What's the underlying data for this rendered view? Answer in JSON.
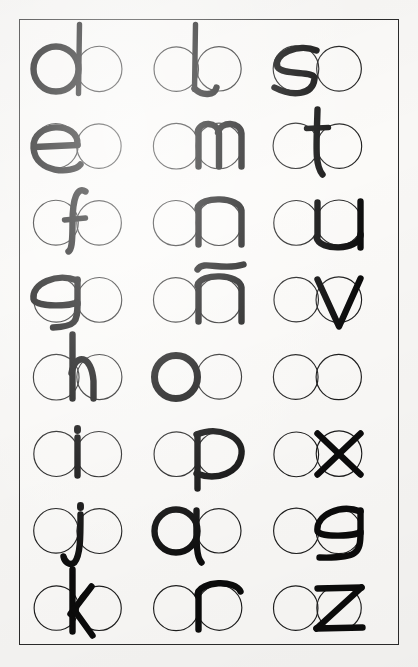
{
  "document": {
    "kind": "calligraphy-letterform-guide",
    "title": "Lowercase letterform construction chart",
    "description": "Lowercase letters drawn over paired guide circles",
    "background_color": "#f8f7f5",
    "paper_color": "#fbfaf8",
    "frame_color": "#2b2b2b",
    "ink_color": "#0b0b0b",
    "guide_color": "#1d1d1d"
  },
  "layout": {
    "rows": 8,
    "columns": 3,
    "cell_width": 118,
    "cell_height": 62,
    "circle_diameter": 45,
    "circles_per_cell": 2
  },
  "grid": {
    "rows": [
      {
        "cells": [
          {
            "letter": "d",
            "position": "left-circle",
            "stroke_weight": "heavy"
          },
          {
            "letter": "b",
            "position": "center",
            "stroke_weight": "heavy"
          },
          {
            "letter": "s",
            "position": "left-circle",
            "stroke_weight": "heavy"
          }
        ]
      },
      {
        "cells": [
          {
            "letter": "e",
            "position": "left-circle",
            "stroke_weight": "heavy"
          },
          {
            "letter": "m",
            "position": "right-circle",
            "stroke_weight": "heavy"
          },
          {
            "letter": "t",
            "position": "center",
            "stroke_weight": "heavy"
          }
        ]
      },
      {
        "cells": [
          {
            "letter": "f",
            "position": "center",
            "stroke_weight": "heavy"
          },
          {
            "letter": "n",
            "position": "right-circle",
            "stroke_weight": "heavy"
          },
          {
            "letter": "u",
            "position": "right-circle",
            "stroke_weight": "heavy"
          }
        ]
      },
      {
        "cells": [
          {
            "letter": "g",
            "position": "left-circle",
            "stroke_weight": "heavy"
          },
          {
            "letter": "ñ",
            "position": "right-circle",
            "stroke_weight": "heavy"
          },
          {
            "letter": "v",
            "position": "right-circle",
            "stroke_weight": "heavy"
          }
        ]
      },
      {
        "cells": [
          {
            "letter": "h",
            "position": "center",
            "stroke_weight": "heavy"
          },
          {
            "letter": "o",
            "position": "left-circle",
            "stroke_weight": "heavy"
          },
          {
            "letter": "w",
            "position": "right-circle",
            "stroke_weight": "heavy"
          }
        ]
      },
      {
        "cells": [
          {
            "letter": "i",
            "position": "center",
            "stroke_weight": "heavy"
          },
          {
            "letter": "p",
            "position": "right-circle",
            "stroke_weight": "heavy"
          },
          {
            "letter": "x",
            "position": "right-circle",
            "stroke_weight": "heavy"
          }
        ]
      },
      {
        "cells": [
          {
            "letter": "j",
            "position": "center",
            "stroke_weight": "heavy"
          },
          {
            "letter": "q",
            "position": "left-circle",
            "stroke_weight": "heavy"
          },
          {
            "letter": "y",
            "position": "right-circle",
            "stroke_weight": "heavy"
          }
        ]
      },
      {
        "cells": [
          {
            "letter": "k",
            "position": "center",
            "stroke_weight": "heavy"
          },
          {
            "letter": "r",
            "position": "right-circle",
            "stroke_weight": "heavy"
          },
          {
            "letter": "z",
            "position": "right-circle",
            "stroke_weight": "heavy"
          }
        ]
      }
    ]
  },
  "alphabet_shown": [
    "d",
    "b",
    "s",
    "e",
    "m",
    "t",
    "f",
    "n",
    "u",
    "g",
    "ñ",
    "v",
    "h",
    "o",
    "w",
    "i",
    "p",
    "x",
    "j",
    "q",
    "y",
    "k",
    "r",
    "z"
  ]
}
